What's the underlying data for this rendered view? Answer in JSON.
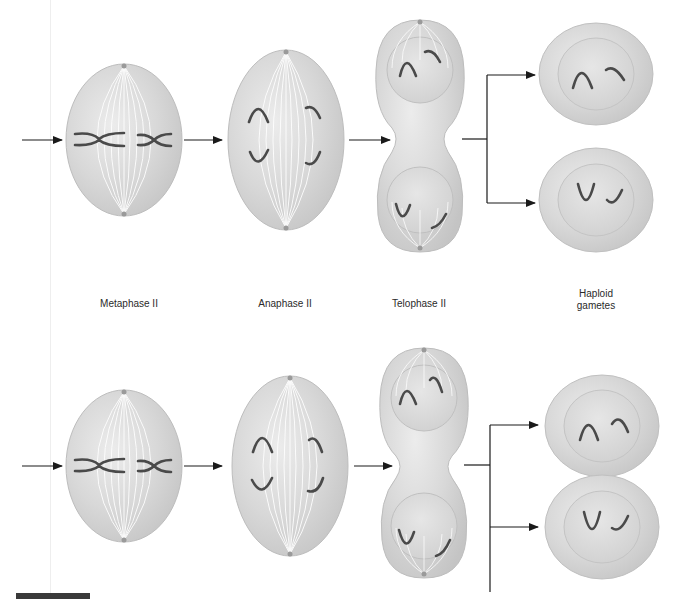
{
  "diagram": {
    "type": "biology-process-diagram",
    "stages": [
      {
        "id": "metaphase",
        "label": "Metaphase II"
      },
      {
        "id": "anaphase",
        "label": "Anaphase II"
      },
      {
        "id": "telophase",
        "label": "Telophase II"
      },
      {
        "id": "gametes",
        "label_line1": "Haploid",
        "label_line2": "gametes"
      }
    ],
    "rows": [
      {
        "id": "row-top",
        "description": "Meiosis II division (upper cell)"
      },
      {
        "id": "row-bottom",
        "description": "Meiosis II division (lower cell)"
      }
    ],
    "colors": {
      "cell_fill": "#d9d9d9",
      "cell_edge": "#bdbdbd",
      "spindle": "#ffffff",
      "chromosome": "#4a4a4a",
      "arrow": "#1a1a1a",
      "background": "#ffffff"
    }
  }
}
